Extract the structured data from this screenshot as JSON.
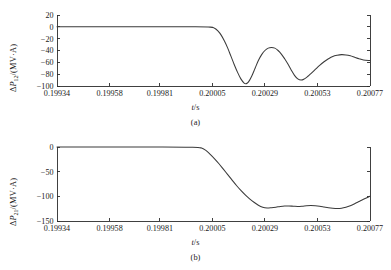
{
  "figure": {
    "panels": [
      {
        "id": "a",
        "caption": "(a)",
        "xlabel_var": "t",
        "xlabel_unit": "/s",
        "ylabel_delta": "Δ",
        "ylabel_var": "P",
        "ylabel_sub": "12",
        "ylabel_unit": "/(MV·A)"
      },
      {
        "id": "b",
        "caption": "(b)",
        "xlabel_var": "t",
        "xlabel_unit": "/s",
        "ylabel_delta": "Δ",
        "ylabel_var": "P",
        "ylabel_sub": "21",
        "ylabel_unit": "/(MV·A)"
      }
    ]
  },
  "chart_data": [
    {
      "type": "line",
      "panel": "a",
      "title": "",
      "xlabel": "t/s",
      "ylabel": "ΔP12/(MV·A)",
      "xlim": [
        0.19934,
        0.20077
      ],
      "ylim": [
        -100,
        20
      ],
      "xticks": [
        0.19934,
        0.19958,
        0.19981,
        0.20005,
        0.20029,
        0.20053,
        0.20077
      ],
      "xticklabels": [
        "0.19934",
        "0.19958",
        "0.19981",
        "0.20005",
        "0.20029",
        "0.20053",
        "0.20077"
      ],
      "yticks": [
        20,
        0,
        -20,
        -40,
        -60,
        -80,
        -100
      ],
      "yticklabels": [
        "20",
        "0",
        "-20",
        "-40",
        "-60",
        "-80",
        "-100"
      ],
      "grid": false,
      "legend": null,
      "series": [
        {
          "name": "ΔP12",
          "x": [
            0.19934,
            0.1995,
            0.19966,
            0.19981,
            0.19996,
            0.20004,
            0.20006,
            0.200075,
            0.20009,
            0.200105,
            0.20012,
            0.200135,
            0.20015,
            0.200165,
            0.20018,
            0.200195,
            0.200205,
            0.200215,
            0.20023,
            0.200245,
            0.20026,
            0.200275,
            0.20029,
            0.200305,
            0.20032,
            0.200335,
            0.20035,
            0.200365,
            0.20038,
            0.200395,
            0.20041,
            0.200425,
            0.20044,
            0.200455,
            0.20047,
            0.200485,
            0.2005,
            0.20052,
            0.20054,
            0.20056,
            0.20058,
            0.2006,
            0.20062,
            0.20064,
            0.20066,
            0.20068,
            0.2007,
            0.20072,
            0.20074,
            0.20077
          ],
          "y": [
            0,
            0,
            0,
            0,
            0,
            -0.5,
            -2.5,
            -7,
            -14,
            -24,
            -36,
            -50,
            -64,
            -77,
            -88,
            -95,
            -96,
            -93,
            -83,
            -70,
            -57,
            -47,
            -40,
            -36,
            -35,
            -36,
            -40,
            -46,
            -54,
            -63,
            -73,
            -82,
            -88,
            -90,
            -88,
            -84,
            -79,
            -72,
            -65,
            -59,
            -54,
            -50,
            -48,
            -47,
            -47.5,
            -49,
            -51.5,
            -54,
            -56,
            -57
          ]
        }
      ]
    },
    {
      "type": "line",
      "panel": "b",
      "title": "",
      "xlabel": "t/s",
      "ylabel": "ΔP21/(MV·A)",
      "xlim": [
        0.19934,
        0.20077
      ],
      "ylim": [
        -150,
        0
      ],
      "xticks": [
        0.19934,
        0.19958,
        0.19981,
        0.20005,
        0.20029,
        0.20053,
        0.20077
      ],
      "xticklabels": [
        "0.19934",
        "0.19958",
        "0.19981",
        "0.20005",
        "0.20029",
        "0.20053",
        "0.20077"
      ],
      "yticks": [
        0,
        -50,
        -100,
        -150
      ],
      "yticklabels": [
        "0",
        "-50",
        "-100",
        "-150"
      ],
      "grid": false,
      "legend": null,
      "series": [
        {
          "name": "ΔP21",
          "x": [
            0.19934,
            0.1995,
            0.19966,
            0.19981,
            0.19996,
            0.2,
            0.20002,
            0.20004,
            0.20006,
            0.20008,
            0.2001,
            0.20012,
            0.20014,
            0.20016,
            0.20018,
            0.2002,
            0.20022,
            0.20024,
            0.20026,
            0.20028,
            0.2003,
            0.20032,
            0.20034,
            0.20036,
            0.20038,
            0.2004,
            0.20042,
            0.20044,
            0.20046,
            0.20048,
            0.2005,
            0.20052,
            0.20054,
            0.20056,
            0.20058,
            0.2006,
            0.20062,
            0.20064,
            0.20066,
            0.20068,
            0.2007,
            0.20072,
            0.20074,
            0.20077
          ],
          "y": [
            0,
            0,
            0,
            0,
            -0.5,
            -2,
            -7,
            -15,
            -24,
            -34,
            -45,
            -56,
            -67,
            -78,
            -88,
            -97,
            -105,
            -112,
            -118,
            -122,
            -123.5,
            -123,
            -122,
            -120.5,
            -119.5,
            -119.5,
            -120,
            -120.5,
            -120,
            -119,
            -118.5,
            -119,
            -120,
            -121.5,
            -123,
            -124,
            -124.5,
            -124,
            -122,
            -119,
            -115,
            -110.5,
            -106,
            -100
          ]
        }
      ]
    }
  ]
}
